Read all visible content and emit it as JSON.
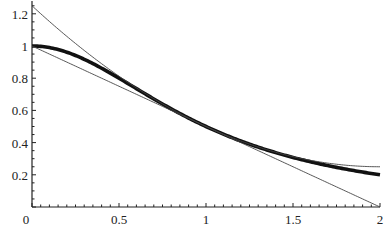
{
  "chart_data": {
    "type": "line",
    "title": "",
    "xlabel": "",
    "ylabel": "",
    "xlim": [
      0,
      2
    ],
    "ylim": [
      0,
      1.25
    ],
    "x_ticks": [
      "0",
      "0.5",
      "1",
      "1.5",
      "2"
    ],
    "y_ticks": [
      "0.2",
      "0.4",
      "0.6",
      "0.8",
      "1",
      "1.2"
    ],
    "grid": false,
    "legend": null,
    "series": [
      {
        "name": "f(x) = 1/(1+x^2)",
        "style": "thick",
        "x": [
          0,
          0.25,
          0.5,
          0.75,
          1,
          1.25,
          1.5,
          1.75,
          2
        ],
        "values": [
          1,
          0.941,
          0.8,
          0.64,
          0.5,
          0.39,
          0.308,
          0.246,
          0.2
        ]
      },
      {
        "name": "linear approximation at x=1",
        "style": "thin",
        "x": [
          0,
          2
        ],
        "values": [
          1,
          0
        ]
      },
      {
        "name": "quadratic approximation at x=1",
        "style": "thin",
        "x": [
          0,
          0.5,
          1,
          1.5,
          2
        ],
        "values": [
          1.25,
          0.8125,
          0.5,
          0.3125,
          0.25
        ]
      }
    ]
  }
}
